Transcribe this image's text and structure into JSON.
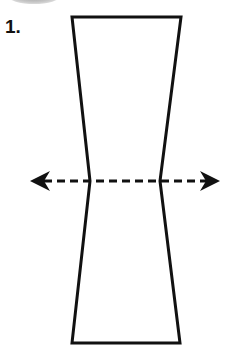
{
  "step": {
    "number_label": "1."
  },
  "diagram": {
    "shape": {
      "top_left": [
        72,
        17
      ],
      "top_right": [
        181,
        17
      ],
      "waist_left": [
        90,
        181
      ],
      "waist_right": [
        160,
        181
      ],
      "bottom_left": [
        72,
        343
      ],
      "bottom_right": [
        180,
        343
      ]
    },
    "arrow": {
      "y": 181,
      "x_start": 30,
      "x_end": 220,
      "style": "dashed",
      "heads": "both"
    },
    "colors": {
      "stroke": "#111111",
      "background": "#ffffff"
    }
  }
}
